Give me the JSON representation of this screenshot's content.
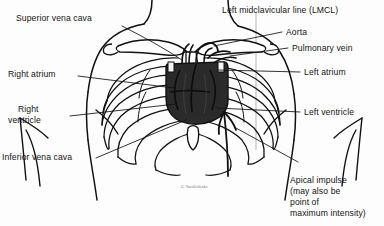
{
  "figure": {
    "kind": "medical-line-illustration",
    "ink_color": "#111111",
    "heart_fill": "#2b2b2b",
    "guide_color": "#b9b9b9",
    "signature": "G. Vassilichenko"
  },
  "labels": {
    "superior_vena_cava": "Superior vena cava",
    "right_atrium": "Right atrium",
    "right_ventricle_l1": "Right",
    "right_ventricle_l2": "ventricle",
    "inferior_vena_cava": "Inferior vena cava",
    "lmcl": "Left midclavicular line (LMCL)",
    "aorta": "Aorta",
    "pulmonary_vein": "Pulmonary vein",
    "left_atrium": "Left atrium",
    "left_ventricle": "Left ventricle",
    "apical_l1": "Apical impulse",
    "apical_l2": "(may also be",
    "apical_l3": "point of",
    "apical_l4": "maximum intensity)"
  },
  "structures": [
    "torso-outline",
    "clavicle-left",
    "clavicle-right",
    "sternum",
    "rib-cage-left",
    "rib-cage-right",
    "xiphoid-process",
    "heart-silhouette",
    "aorta-arch",
    "pulmonary-vessels",
    "left-midclavicular-line",
    "apical-impulse-marker"
  ]
}
